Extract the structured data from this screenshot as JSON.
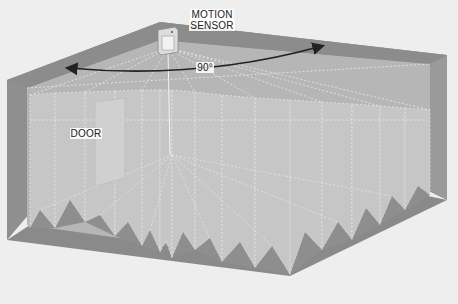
{
  "diagram": {
    "type": "motion-sensor-coverage-illustration",
    "labels": {
      "sensor_line1": "MOTION",
      "sensor_line2": "SENSOR",
      "angle": "90°",
      "door": "DOOR"
    },
    "colors": {
      "background": "#eeeeee",
      "wall_dark": "#8e8e8e",
      "wall_mid": "#9c9c9c",
      "floor": "#b2b2b2",
      "beam_fill": "#c4c4c4",
      "beam_dash": "#e6e6e6",
      "arrow": "#222222",
      "door": "#cfcfcf"
    },
    "coverage_angle_degrees": 90,
    "beam_count": 15
  }
}
